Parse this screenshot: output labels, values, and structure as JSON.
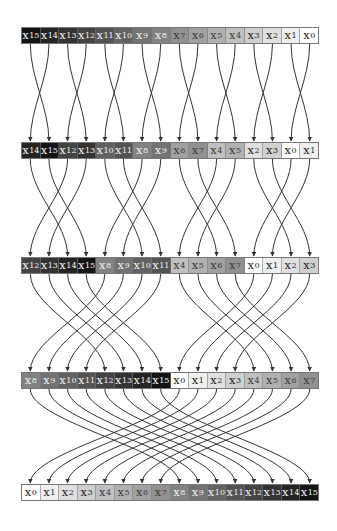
{
  "diagram": {
    "variable_prefix": "x",
    "colors": {
      "wire": "#333333",
      "shade_light": "#ffffff",
      "shade_dark": "#141414"
    },
    "rows": [
      {
        "y": 27,
        "label": "row-1",
        "order": [
          15,
          14,
          13,
          12,
          11,
          10,
          9,
          8,
          7,
          6,
          5,
          4,
          3,
          2,
          1,
          0
        ]
      },
      {
        "y": 142,
        "label": "row-2",
        "order": [
          14,
          15,
          12,
          13,
          10,
          11,
          8,
          9,
          6,
          7,
          4,
          5,
          2,
          3,
          0,
          1
        ]
      },
      {
        "y": 257,
        "label": "row-3",
        "order": [
          12,
          13,
          14,
          15,
          8,
          9,
          10,
          11,
          4,
          5,
          6,
          7,
          0,
          1,
          2,
          3
        ]
      },
      {
        "y": 372,
        "label": "row-4",
        "order": [
          8,
          9,
          10,
          11,
          12,
          13,
          14,
          15,
          0,
          1,
          2,
          3,
          4,
          5,
          6,
          7
        ]
      },
      {
        "y": 484,
        "label": "row-5",
        "order": [
          0,
          1,
          2,
          3,
          4,
          5,
          6,
          7,
          8,
          9,
          10,
          11,
          12,
          13,
          14,
          15
        ]
      }
    ],
    "stages": [
      {
        "from_row": 0,
        "to_row": 1,
        "swap_distance": 1
      },
      {
        "from_row": 1,
        "to_row": 2,
        "swap_distance": 2
      },
      {
        "from_row": 2,
        "to_row": 3,
        "swap_distance": 4
      },
      {
        "from_row": 3,
        "to_row": 4,
        "swap_distance": 8
      }
    ]
  }
}
